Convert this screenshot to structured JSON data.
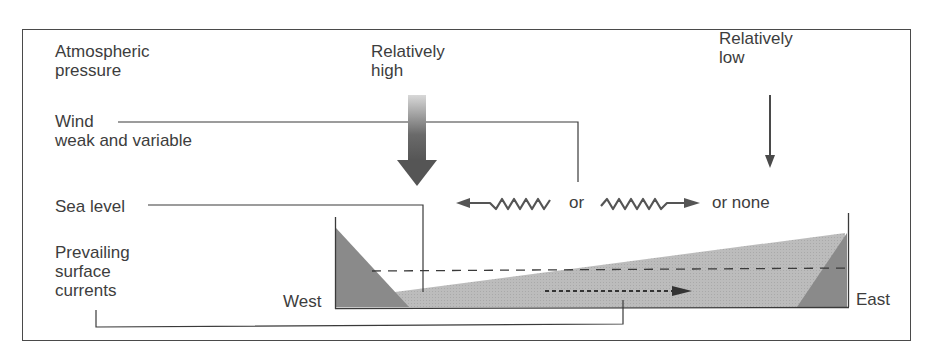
{
  "labels": {
    "atmospheric_pressure": "Atmospheric\npressure",
    "pressure_high": "Relatively\nhigh",
    "pressure_low": "Relatively\nlow",
    "wind": "Wind",
    "wind_desc": "weak and variable",
    "wind_or": "or",
    "wind_or_none": "or none",
    "sea_level": "Sea level",
    "currents": "Prevailing\nsurface\ncurrents",
    "west": "West",
    "east": "East"
  },
  "icons": {
    "high_pressure_arrow": "large-down-arrow-icon",
    "low_pressure_arrow": "thin-down-arrow-icon",
    "wind_west_arrow": "wavy-left-arrow-icon",
    "wind_east_arrow": "wavy-right-arrow-icon",
    "current_arrow": "dotted-right-arrow-icon"
  },
  "colors": {
    "land": "#8a8a8a",
    "water": "#bdbdbd",
    "line": "#3a3a3a",
    "frame": "#4a4a4a"
  }
}
